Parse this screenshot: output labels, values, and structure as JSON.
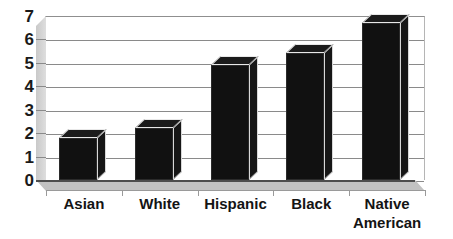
{
  "chart_data": {
    "type": "bar",
    "title": "",
    "subtitle": "",
    "xlabel": "",
    "ylabel": "",
    "categories": [
      "Asian",
      "White",
      "Hispanic",
      "Black",
      "Native American"
    ],
    "values": [
      1.8,
      2.2,
      4.9,
      5.4,
      6.7
    ],
    "ylim": [
      0,
      7
    ],
    "ytick_labels": [
      "0",
      "1",
      "2",
      "3",
      "4",
      "5",
      "6",
      "7"
    ],
    "ytick_values": [
      0,
      1,
      2,
      3,
      4,
      5,
      6,
      7
    ],
    "grid": true,
    "legend": false,
    "legend_position": "none",
    "style": "3d-column",
    "colors": {
      "bar_fill": "#111111",
      "bar_top": "#1b1b1b",
      "bar_side": "#161616",
      "bar_edge_highlight": "#e8e8e8",
      "gridline": "#8a8a8a",
      "wall": "#d3d3d3",
      "floor": "#c2c2c2",
      "axis": "#4d4d4d",
      "text": "#141414",
      "background": "#ffffff"
    }
  },
  "axis": {
    "y": {
      "ticks": [
        {
          "label": "7",
          "value": 7
        },
        {
          "label": "6",
          "value": 6
        },
        {
          "label": "5",
          "value": 5
        },
        {
          "label": "4",
          "value": 4
        },
        {
          "label": "3",
          "value": 3
        },
        {
          "label": "2",
          "value": 2
        },
        {
          "label": "1",
          "value": 1
        },
        {
          "label": "0",
          "value": 0
        }
      ]
    },
    "x": {
      "ticks": [
        {
          "label": "Asian",
          "line1": "Asian",
          "line2": ""
        },
        {
          "label": "White",
          "line1": "White",
          "line2": ""
        },
        {
          "label": "Hispanic",
          "line1": "Hispanic",
          "line2": ""
        },
        {
          "label": "Black",
          "line1": "Black",
          "line2": ""
        },
        {
          "label": "Native American",
          "line1": "Native",
          "line2": "American"
        }
      ]
    }
  }
}
